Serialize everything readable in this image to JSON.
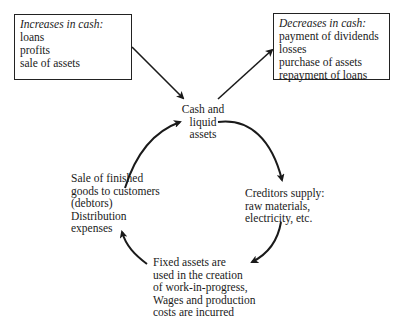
{
  "increases_box": {
    "title": "Increases in cash:",
    "items": [
      "loans",
      "profits",
      "sale of assets"
    ]
  },
  "decreases_box": {
    "title": "Decreases in cash:",
    "items": [
      "payment of dividends",
      "losses",
      "purchase of assets",
      "repayment of loans"
    ]
  },
  "cycle": {
    "cash": [
      "Cash and",
      "liquid",
      "assets"
    ],
    "creditors": [
      "Creditors supply:",
      "raw materials,",
      "electricity, etc."
    ],
    "fixed_assets": [
      "Fixed assets are",
      "used in the creation",
      "of work-in-progress,",
      "Wages and production",
      "costs are incurred"
    ],
    "sales": [
      "Sale of finished",
      "goods to customers",
      "(debtors)",
      "Distribution",
      "expenses"
    ]
  },
  "colors": {
    "ink": "#1a1a1a",
    "background": "#ffffff"
  }
}
